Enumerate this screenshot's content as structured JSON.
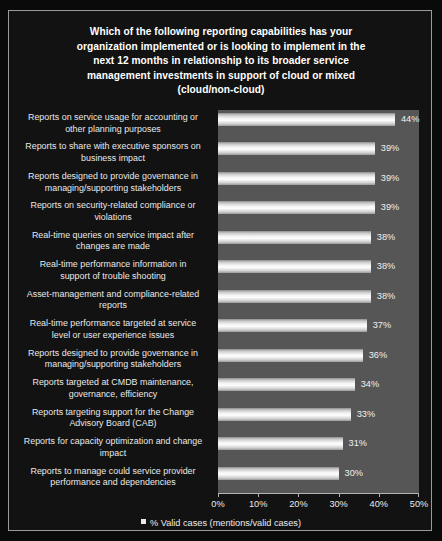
{
  "chart_data": {
    "type": "bar",
    "orientation": "horizontal",
    "title_lines": [
      "Which of the following reporting capabilities has your",
      "organization implemented or is looking to implement in the",
      "next 12 months in relationship to its broader service",
      "management investments in support of cloud or mixed",
      "(cloud/non-cloud)"
    ],
    "categories": [
      "Reports on service usage for accounting or other planning purposes",
      "Reports to share with executive sponsors on business impact",
      "Reports designed to provide governance in managing/supporting stakeholders",
      "Reports on security-related compliance or violations",
      "Real-time queries on service impact after changes are made",
      "Real-time performance information in support of trouble shooting",
      "Asset-management and compliance-related reports",
      "Real-time performance targeted at service level or user experience issues",
      "Reports designed to provide governance in managing/supporting stakeholders",
      "Reports targeted at CMDB maintenance, governance, efficiency",
      "Reports targeting support for the Change Advisory Board (CAB)",
      "Reports for capacity optimization and change impact",
      "Reports to manage could service provider performance and dependencies"
    ],
    "category_lines": [
      [
        "Reports on service usage for accounting or",
        "other planning purposes"
      ],
      [
        "Reports to share with executive sponsors on",
        "business impact"
      ],
      [
        "Reports designed to provide governance in",
        "managing/supporting stakeholders"
      ],
      [
        "Reports on security-related compliance or",
        "violations"
      ],
      [
        "Real-time queries on service impact after",
        "changes are made"
      ],
      [
        "Real-time performance information in",
        "support of trouble shooting"
      ],
      [
        "Asset-management and compliance-related",
        "reports"
      ],
      [
        "Real-time performance targeted at service",
        "level or user experience issues"
      ],
      [
        "Reports designed to provide governance in",
        "managing/supporting stakeholders"
      ],
      [
        "Reports targeted at CMDB maintenance,",
        "governance, efficiency"
      ],
      [
        "Reports targeting support for the Change",
        "Advisory Board (CAB)"
      ],
      [
        "Reports for capacity optimization and change",
        "impact"
      ],
      [
        "Reports to manage could service provider",
        "performance and dependencies"
      ]
    ],
    "values": [
      44,
      39,
      39,
      39,
      38,
      38,
      38,
      37,
      36,
      34,
      33,
      31,
      30
    ],
    "value_labels": [
      "44%",
      "39%",
      "39%",
      "39%",
      "38%",
      "38%",
      "38%",
      "37%",
      "36%",
      "34%",
      "33%",
      "31%",
      "30%"
    ],
    "xlabel": "",
    "ylabel": "",
    "xlim": [
      0,
      50
    ],
    "xticks": [
      0,
      10,
      20,
      30,
      40,
      50
    ],
    "xtick_labels": [
      "0%",
      "10%",
      "20%",
      "30%",
      "40%",
      "50%"
    ],
    "grid": false,
    "legend": {
      "position": "bottom",
      "entries": [
        "% Valid cases (mentions/valid cases)"
      ]
    },
    "colors": {
      "panel_background": "#121212",
      "plot_background": "#565656",
      "bar_fill": "#f6f6f6",
      "text": "#eaeaea",
      "panel_border": "#9a9a9a"
    }
  }
}
